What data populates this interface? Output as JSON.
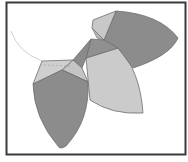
{
  "diagram": {
    "type": "geometric-leaf-polyhedron",
    "colors": {
      "background": "#ffffff",
      "frame": "#3a3a3a",
      "dark_fill": "#8a8a8a",
      "mid_fill": "#9c9c9c",
      "light_fill": "#c8c8c8",
      "lighter_fill": "#d4d4d4",
      "edge": "#6e6e6e",
      "curve": "#d0d0d0",
      "dashed": "#a0a0a0"
    },
    "frame": {
      "x": 6,
      "y": 2,
      "width": 179,
      "height": 153
    },
    "shapes": [
      {
        "name": "left-leaf-dark",
        "shade": "dark"
      },
      {
        "name": "left-cap-light",
        "shade": "light"
      },
      {
        "name": "top-right-leaf-dark",
        "shade": "dark"
      },
      {
        "name": "top-cap-light",
        "shade": "light"
      },
      {
        "name": "center-leaf-light",
        "shade": "light"
      },
      {
        "name": "center-facets-dark",
        "shade": "mid"
      }
    ]
  }
}
